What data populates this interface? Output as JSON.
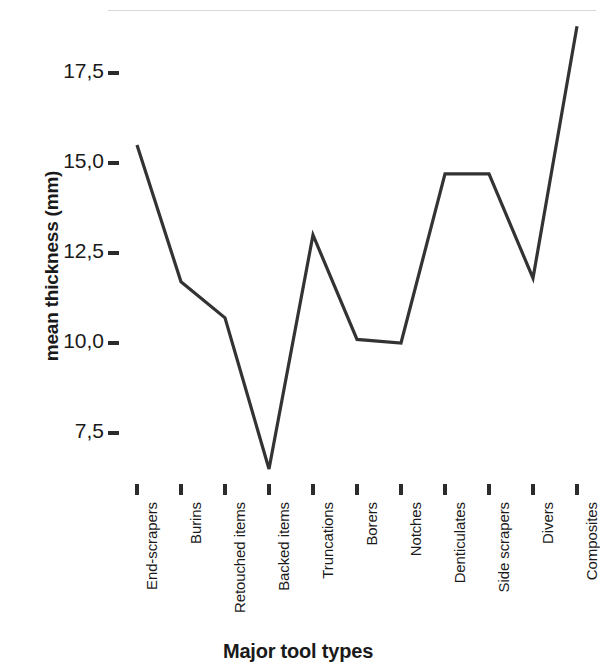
{
  "chart_data": {
    "type": "line",
    "title": "",
    "xlabel": "Major tool types",
    "ylabel": "mean thickness (mm)",
    "categories": [
      "End-scrapers",
      "Burins",
      "Retouched items",
      "Backed items",
      "Truncations",
      "Borers",
      "Notches",
      "Denticulates",
      "Side scrapers",
      "Divers",
      "Composites"
    ],
    "values": [
      15.5,
      11.7,
      10.7,
      6.5,
      13.0,
      10.1,
      10.0,
      14.7,
      14.7,
      11.8,
      18.8
    ],
    "ytick_labels": [
      "17,5",
      "15,0",
      "12,5",
      "10,0",
      "7,5"
    ],
    "ytick_values": [
      17.5,
      15.0,
      12.5,
      10.0,
      7.5
    ],
    "ylim": [
      6.0,
      19.2
    ],
    "grid": false,
    "legend": null,
    "line_color": "#333333",
    "background_color": "#ffffff"
  },
  "axes": {
    "y_title": "mean thickness (mm)",
    "x_title": "Major tool types"
  }
}
